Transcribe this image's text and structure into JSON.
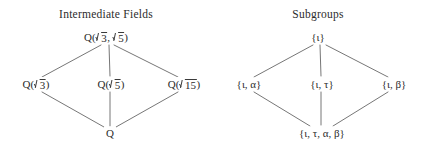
{
  "figure": {
    "name": "galois-correspondence-lattices",
    "background_color": "#ffffff",
    "line_color": "#555555",
    "text_color": "#2b2b2b"
  },
  "panels": [
    {
      "id": "intermediate-fields",
      "title": "Intermediate Fields",
      "nodes": [
        {
          "id": "top",
          "label": "Q(√3, √5)",
          "prefix": "Q(",
          "radicands": [
            "3",
            "5"
          ],
          "suffix": ")",
          "x": 106,
          "y": 37
        },
        {
          "id": "left",
          "label": "Q(√3)",
          "prefix": "Q(",
          "radicands": [
            "3"
          ],
          "suffix": ")",
          "x": 36,
          "y": 84
        },
        {
          "id": "middle",
          "label": "Q(√5)",
          "prefix": "Q(",
          "radicands": [
            "5"
          ],
          "suffix": ")",
          "x": 111,
          "y": 84
        },
        {
          "id": "right",
          "label": "Q(√15)",
          "prefix": "Q(",
          "radicands": [
            "15"
          ],
          "suffix": ")",
          "x": 184,
          "y": 84
        },
        {
          "id": "bottom",
          "label": "Q",
          "prefix": "Q",
          "radicands": [],
          "suffix": "",
          "x": 110,
          "y": 133
        }
      ],
      "edges": [
        {
          "from": "top",
          "to": "left"
        },
        {
          "from": "top",
          "to": "middle"
        },
        {
          "from": "top",
          "to": "right"
        },
        {
          "from": "left",
          "to": "bottom"
        },
        {
          "from": "middle",
          "to": "bottom"
        },
        {
          "from": "right",
          "to": "bottom"
        }
      ]
    },
    {
      "id": "subgroups",
      "title": "Subgroups",
      "nodes": [
        {
          "id": "top",
          "label": "{ι}",
          "x": 106,
          "y": 37
        },
        {
          "id": "left",
          "label": "{ι, α}",
          "x": 37,
          "y": 84
        },
        {
          "id": "middle",
          "label": "{ι, τ}",
          "x": 110,
          "y": 84
        },
        {
          "id": "right",
          "label": "{ι, β}",
          "x": 182,
          "y": 84
        },
        {
          "id": "bottom",
          "label": "{ι, τ, α, β}",
          "x": 110,
          "y": 133
        }
      ],
      "edges": [
        {
          "from": "top",
          "to": "left"
        },
        {
          "from": "top",
          "to": "middle"
        },
        {
          "from": "top",
          "to": "right"
        },
        {
          "from": "left",
          "to": "bottom"
        },
        {
          "from": "middle",
          "to": "bottom"
        },
        {
          "from": "right",
          "to": "bottom"
        }
      ]
    }
  ]
}
